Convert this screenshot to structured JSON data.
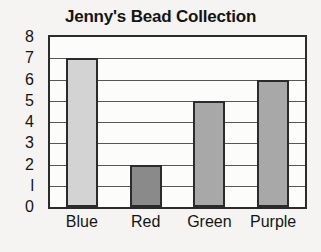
{
  "chart_data": {
    "type": "bar",
    "title": "Jenny's Bead Collection",
    "xlabel": "",
    "ylabel": "",
    "categories": [
      "Blue",
      "Red",
      "Green",
      "Purple"
    ],
    "values": [
      7,
      2,
      5,
      6
    ],
    "ylim": [
      0,
      8
    ],
    "ytick_labels": [
      "0",
      "l",
      "2",
      "3",
      "4",
      "5",
      "6",
      "7",
      "8"
    ],
    "ytick_values": [
      0,
      1,
      2,
      3,
      4,
      5,
      6,
      7,
      8
    ],
    "grid": "horizontal",
    "legend": "none",
    "bar_colors": [
      "#d3d3d3",
      "#8a8a8a",
      "#a8a8a8",
      "#a8a8a8"
    ],
    "bar_border_color": "#2b2b2b",
    "plot_background": "#fcfcfb",
    "page_background": "#f5f4f2",
    "text_color": "#141414",
    "gridline_color": "#575757"
  }
}
